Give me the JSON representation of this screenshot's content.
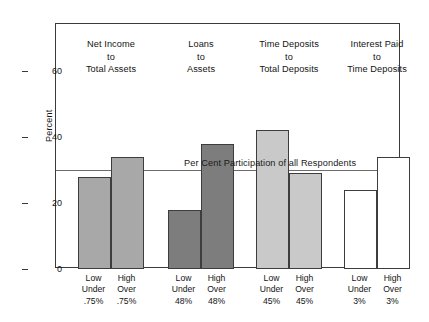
{
  "chart_data": {
    "type": "bar",
    "title": "",
    "xlabel": "",
    "ylabel": "Percent",
    "ylim": [
      0,
      75
    ],
    "yticks": [
      0,
      20,
      40,
      60
    ],
    "grid": false,
    "legend": "none",
    "reference_line": {
      "value": 30,
      "label": "Per Cent Participation of all Respondents"
    },
    "groups": [
      {
        "header": [
          "Net Income",
          "to",
          "Total Assets"
        ],
        "fill": "#a8a8a8",
        "bars": [
          {
            "label": [
              "Low",
              "Under",
              ".75%"
            ],
            "value": 28
          },
          {
            "label": [
              "High",
              "Over",
              ".75%"
            ],
            "value": 34
          }
        ]
      },
      {
        "header": [
          "Loans",
          "to",
          "Assets"
        ],
        "fill": "#7d7d7d",
        "bars": [
          {
            "label": [
              "Low",
              "Under",
              "48%"
            ],
            "value": 18
          },
          {
            "label": [
              "High",
              "Over",
              "48%"
            ],
            "value": 38
          }
        ]
      },
      {
        "header": [
          "Time Deposits",
          "to",
          "Total Deposits"
        ],
        "fill": "#c9c9c9",
        "bars": [
          {
            "label": [
              "Low",
              "Under",
              "45%"
            ],
            "value": 42
          },
          {
            "label": [
              "High",
              "Over",
              "45%"
            ],
            "value": 29
          }
        ]
      },
      {
        "header": [
          "Interest Paid",
          "to",
          "Time Deposits"
        ],
        "fill": "#ffffff",
        "bars": [
          {
            "label": [
              "Low",
              "Under",
              "3%"
            ],
            "value": 24
          },
          {
            "label": [
              "High",
              "Over",
              "3%"
            ],
            "value": 34
          }
        ]
      }
    ]
  },
  "colors": {
    "axis": "#3a3a3a",
    "reference_line": "#6d6d6d",
    "text": "#141414",
    "background": "#ffffff"
  }
}
